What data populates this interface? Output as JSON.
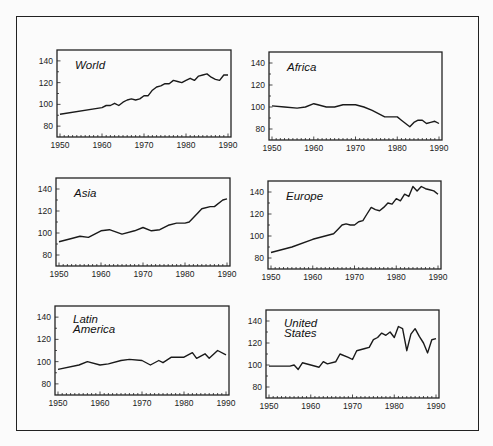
{
  "chart_data": [
    {
      "type": "line",
      "title": "World",
      "xlabel": "",
      "ylabel": "",
      "xlim": [
        1950,
        1990
      ],
      "ylim": [
        70,
        150
      ],
      "xticks": [
        1950,
        1960,
        1970,
        1980,
        1990
      ],
      "yticks": [
        80,
        100,
        120,
        140
      ],
      "grid": false,
      "x": [
        1950,
        1960,
        1961,
        1962,
        1963,
        1964,
        1965,
        1966,
        1967,
        1968,
        1969,
        1970,
        1971,
        1972,
        1973,
        1974,
        1975,
        1976,
        1977,
        1978,
        1979,
        1980,
        1981,
        1982,
        1983,
        1984,
        1985,
        1986,
        1987,
        1988,
        1989,
        1990
      ],
      "values": [
        91,
        97,
        99,
        99,
        101,
        99,
        102,
        104,
        105,
        104,
        105,
        108,
        108,
        113,
        116,
        117,
        119,
        119,
        122,
        121,
        120,
        122,
        124,
        122,
        126,
        127,
        128,
        125,
        123,
        122,
        127,
        127
      ]
    },
    {
      "type": "line",
      "title": "Africa",
      "xlabel": "",
      "ylabel": "",
      "xlim": [
        1950,
        1990
      ],
      "ylim": [
        70,
        150
      ],
      "xticks": [
        1950,
        1960,
        1970,
        1980,
        1990
      ],
      "yticks": [
        80,
        100,
        120,
        140
      ],
      "grid": false,
      "x": [
        1950,
        1953,
        1956,
        1958,
        1960,
        1961,
        1963,
        1965,
        1967,
        1970,
        1972,
        1974,
        1977,
        1980,
        1981,
        1983,
        1984,
        1985,
        1986,
        1987,
        1988,
        1989,
        1990
      ],
      "values": [
        101,
        100,
        99,
        100,
        103,
        102,
        100,
        100,
        102,
        102,
        100,
        97,
        91,
        91,
        88,
        82,
        86,
        88,
        88,
        85,
        86,
        87,
        85
      ]
    },
    {
      "type": "line",
      "title": "Asia",
      "xlabel": "",
      "ylabel": "",
      "xlim": [
        1950,
        1990
      ],
      "ylim": [
        70,
        150
      ],
      "xticks": [
        1950,
        1960,
        1970,
        1980,
        1990
      ],
      "yticks": [
        80,
        100,
        120,
        140
      ],
      "grid": false,
      "x": [
        1950,
        1953,
        1955,
        1957,
        1960,
        1962,
        1965,
        1968,
        1970,
        1972,
        1974,
        1976,
        1978,
        1980,
        1981,
        1983,
        1984,
        1986,
        1987,
        1989,
        1990
      ],
      "values": [
        92,
        95,
        97,
        96,
        102,
        103,
        99,
        102,
        105,
        102,
        103,
        107,
        109,
        109,
        110,
        118,
        122,
        124,
        124,
        130,
        131
      ]
    },
    {
      "type": "line",
      "title": "Europe",
      "xlabel": "",
      "ylabel": "",
      "xlim": [
        1950,
        1990
      ],
      "ylim": [
        70,
        150
      ],
      "xticks": [
        1950,
        1960,
        1970,
        1980,
        1990
      ],
      "yticks": [
        80,
        100,
        120,
        140
      ],
      "grid": false,
      "x": [
        1950,
        1955,
        1960,
        1965,
        1966,
        1967,
        1968,
        1969,
        1970,
        1971,
        1972,
        1973,
        1974,
        1975,
        1976,
        1977,
        1978,
        1979,
        1980,
        1981,
        1982,
        1983,
        1984,
        1985,
        1986,
        1987,
        1988,
        1989,
        1990
      ],
      "values": [
        85,
        90,
        97,
        102,
        106,
        110,
        111,
        110,
        110,
        113,
        114,
        120,
        126,
        124,
        123,
        126,
        130,
        129,
        134,
        132,
        138,
        136,
        145,
        141,
        145,
        143,
        142,
        141,
        138
      ]
    },
    {
      "type": "line",
      "title": "Latin America",
      "xlabel": "",
      "ylabel": "",
      "xlim": [
        1950,
        1990
      ],
      "ylim": [
        70,
        150
      ],
      "xticks": [
        1950,
        1960,
        1970,
        1980,
        1990
      ],
      "yticks": [
        80,
        100,
        120,
        140
      ],
      "grid": false,
      "x": [
        1950,
        1955,
        1957,
        1960,
        1962,
        1965,
        1967,
        1970,
        1972,
        1974,
        1975,
        1977,
        1980,
        1982,
        1983,
        1985,
        1986,
        1988,
        1990
      ],
      "values": [
        93,
        97,
        100,
        97,
        98,
        101,
        102,
        101,
        97,
        101,
        99,
        104,
        104,
        108,
        103,
        107,
        103,
        110,
        106
      ]
    },
    {
      "type": "line",
      "title": "United States",
      "xlabel": "",
      "ylabel": "",
      "xlim": [
        1950,
        1990
      ],
      "ylim": [
        70,
        150
      ],
      "xticks": [
        1950,
        1960,
        1970,
        1980,
        1990
      ],
      "yticks": [
        80,
        100,
        120,
        140
      ],
      "grid": false,
      "x": [
        1950,
        1955,
        1956,
        1957,
        1958,
        1960,
        1962,
        1963,
        1964,
        1966,
        1967,
        1969,
        1970,
        1971,
        1973,
        1974,
        1975,
        1976,
        1977,
        1978,
        1979,
        1980,
        1981,
        1982,
        1983,
        1984,
        1985,
        1986,
        1987,
        1988,
        1989,
        1990
      ],
      "values": [
        99,
        99,
        100,
        96,
        102,
        100,
        98,
        103,
        101,
        103,
        110,
        107,
        105,
        113,
        115,
        116,
        123,
        125,
        129,
        127,
        130,
        125,
        135,
        133,
        113,
        128,
        133,
        126,
        120,
        111,
        123,
        124
      ]
    }
  ],
  "panels": [
    {
      "title_lines": [
        "World"
      ]
    },
    {
      "title_lines": [
        "Africa"
      ]
    },
    {
      "title_lines": [
        "Asia"
      ]
    },
    {
      "title_lines": [
        "Europe"
      ]
    },
    {
      "title_lines": [
        "Latin",
        "America"
      ]
    },
    {
      "title_lines": [
        "United",
        "States"
      ]
    }
  ],
  "axis": {
    "x_tick_labels": [
      "1950",
      "1960",
      "1970",
      "1980",
      "1990"
    ],
    "y_tick_labels": [
      "80",
      "100",
      "120",
      "140"
    ]
  },
  "colors": {
    "line": "#1a1a1a",
    "frame": "#222222",
    "background": "#fbfbfb"
  }
}
